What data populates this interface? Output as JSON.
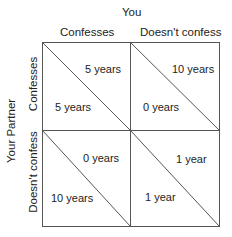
{
  "column_player": "You",
  "row_player": "Your Partner",
  "columns": [
    "Confesses",
    "Doesn't confess"
  ],
  "rows": [
    "Confesses",
    "Doesn't confess"
  ],
  "cells": [
    [
      {
        "you": "5 years",
        "partner": "5 years"
      },
      {
        "you": "10 years",
        "partner": "0 years"
      }
    ],
    [
      {
        "you": "0 years",
        "partner": "10 years"
      },
      {
        "you": "1 year",
        "partner": "1 year"
      }
    ]
  ],
  "colors": {
    "line": "#555555",
    "text": "#222222"
  }
}
